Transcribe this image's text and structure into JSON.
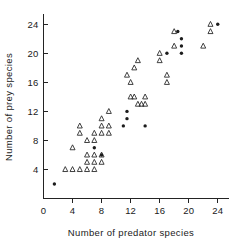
{
  "chart_data": {
    "type": "scatter",
    "title": "",
    "xlabel": "Number of predator species",
    "ylabel": "Number of prey species",
    "xlim": [
      0,
      25.5
    ],
    "ylim": [
      0,
      25.5
    ],
    "xticks": [
      0,
      4,
      8,
      12,
      16,
      20,
      24
    ],
    "xticklabels": [
      "0",
      "4",
      "8",
      "12",
      "16",
      "20",
      "24"
    ],
    "yticks": [
      4,
      8,
      12,
      16,
      20,
      24
    ],
    "yticklabels": [
      "4",
      "8",
      "12",
      "16",
      "20",
      "24"
    ],
    "grid": false,
    "legend": false,
    "series": [
      {
        "name": "open-triangle",
        "marker": "triangle-up-open",
        "color": "#2b2b2b",
        "points": [
          [
            3,
            4
          ],
          [
            4,
            4
          ],
          [
            5,
            4
          ],
          [
            6,
            4
          ],
          [
            7,
            4
          ],
          [
            4,
            7
          ],
          [
            6,
            6
          ],
          [
            7,
            6
          ],
          [
            8,
            6
          ],
          [
            6,
            5
          ],
          [
            7,
            5
          ],
          [
            8,
            5
          ],
          [
            6,
            8
          ],
          [
            7,
            8
          ],
          [
            5,
            9
          ],
          [
            5,
            10
          ],
          [
            7,
            9
          ],
          [
            8,
            9
          ],
          [
            8,
            10
          ],
          [
            9,
            9
          ],
          [
            8,
            11
          ],
          [
            9,
            10
          ],
          [
            9,
            12
          ],
          [
            11.5,
            17
          ],
          [
            12,
            16
          ],
          [
            12.5,
            18
          ],
          [
            13,
            19
          ],
          [
            12,
            14
          ],
          [
            12.5,
            14
          ],
          [
            13,
            13
          ],
          [
            13.5,
            13
          ],
          [
            14,
            14
          ],
          [
            14,
            13
          ],
          [
            16,
            19
          ],
          [
            16,
            20
          ],
          [
            17,
            16
          ],
          [
            17,
            17
          ],
          [
            18,
            21
          ],
          [
            18,
            23
          ],
          [
            22,
            21
          ],
          [
            23,
            23
          ],
          [
            23,
            24
          ]
        ]
      },
      {
        "name": "filled-dot",
        "marker": "circle-filled",
        "color": "#1c1c1c",
        "points": [
          [
            1.5,
            2
          ],
          [
            7,
            7
          ],
          [
            8,
            6
          ],
          [
            11,
            10
          ],
          [
            11.5,
            11
          ],
          [
            11.5,
            12
          ],
          [
            14,
            10
          ],
          [
            17,
            20
          ],
          [
            18.5,
            23
          ],
          [
            19,
            22
          ],
          [
            19,
            21
          ],
          [
            19,
            20
          ],
          [
            24,
            24
          ]
        ]
      }
    ]
  },
  "figure": {
    "background": "#ffffff",
    "axis_color": "#232323"
  }
}
